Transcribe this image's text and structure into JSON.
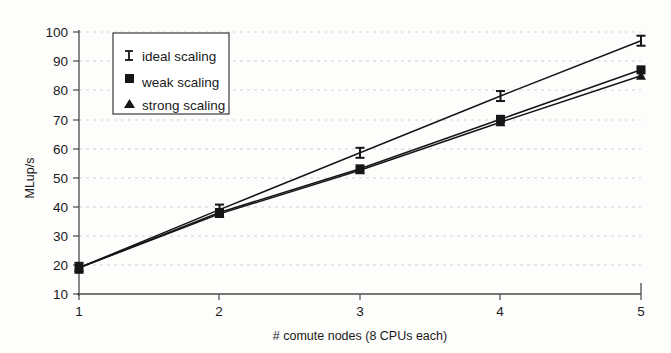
{
  "chart_data": {
    "type": "line",
    "title": "",
    "subtitle": "",
    "xlabel": "# comute nodes (8 CPUs each)",
    "ylabel": "MLup/s",
    "x": [
      1,
      2,
      3,
      4,
      5
    ],
    "xlim": [
      1,
      5
    ],
    "ylim": [
      10,
      100
    ],
    "xticks": [
      "1",
      "2",
      "3",
      "4",
      "5"
    ],
    "yticks": [
      "10",
      "20",
      "30",
      "40",
      "50",
      "60",
      "70",
      "80",
      "90",
      "100"
    ],
    "grid": "horizontal-dotted",
    "legend_position": "upper-left-inside",
    "series": [
      {
        "name": "ideal scaling",
        "marker": "ibeam",
        "color": "#161616",
        "values": [
          19,
          39,
          58.5,
          78,
          97
        ]
      },
      {
        "name": "weak scaling",
        "marker": "square",
        "color": "#161616",
        "values": [
          19,
          38,
          53,
          70,
          87
        ]
      },
      {
        "name": "strong scaling",
        "marker": "triangle",
        "color": "#161616",
        "values": [
          19,
          37.5,
          52.5,
          69,
          85
        ]
      }
    ]
  },
  "legend": {
    "items": [
      {
        "label": "ideal scaling",
        "marker": "ibeam-marker-icon"
      },
      {
        "label": "weak scaling",
        "marker": "square-marker-icon"
      },
      {
        "label": "strong scaling",
        "marker": "triangle-marker-icon"
      }
    ]
  },
  "axes": {
    "y_title": "MLup/s",
    "x_title": "# comute nodes (8 CPUs each)",
    "y_tick_labels": [
      "100",
      "90",
      "80",
      "70",
      "60",
      "50",
      "40",
      "30",
      "20",
      "10"
    ],
    "x_tick_labels": [
      "1",
      "2",
      "3",
      "4",
      "5"
    ]
  },
  "colors": {
    "ink": "#161616",
    "axis": "#4a4a4a",
    "grid": "#cfcfcf",
    "background": "#ffffff"
  }
}
